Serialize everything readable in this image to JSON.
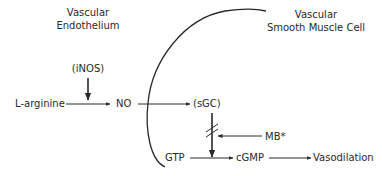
{
  "diagram": {
    "regions": {
      "endothelium": {
        "line1": "Vascular",
        "line2": "Endothelium"
      },
      "smooth_muscle": {
        "line1": "Vascular",
        "line2": "Smooth Muscle Cell"
      }
    },
    "nodes": {
      "inos": "(iNOS)",
      "l_arginine": "L-arginine",
      "no": "NO",
      "sgc": "(sGC)",
      "mb": "MB*",
      "gtp": "GTP",
      "cgmp": "cGMP",
      "vasodilation": "Vasodilation"
    },
    "colors": {
      "line": "#2a2a2a",
      "text": "#2a2a2a",
      "background": "#ffffff"
    }
  }
}
